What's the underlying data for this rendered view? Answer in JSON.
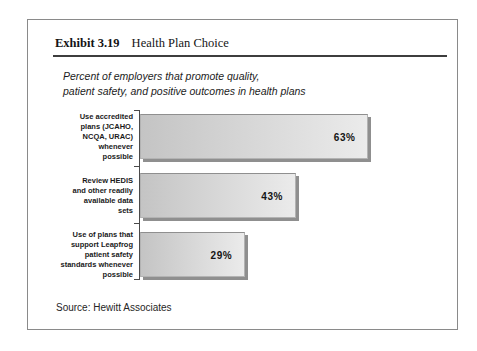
{
  "exhibit": {
    "number": "Exhibit 3.19",
    "title": "Health Plan Choice"
  },
  "subtitle": "Percent of employers that promote quality,\npatient safety, and positive outcomes in health plans",
  "source": "Source: Hewitt Associates",
  "chart_data": {
    "type": "bar",
    "orientation": "horizontal",
    "title": "Percent of employers that promote quality, patient safety, and positive outcomes in health plans",
    "categories": [
      "Use accredited\nplans (JCAHO,\nNCQA, URAC)\nwhenever\npossible",
      "Review HEDIS\nand other readily\navailable data\nsets",
      "Use of plans that\nsupport Leapfrog\npatient safety\nstandards whenever\npossible"
    ],
    "values": [
      63,
      43,
      29
    ],
    "value_labels": [
      "63%",
      "43%",
      "29%"
    ],
    "xlabel": "",
    "ylabel": "",
    "xlim": [
      0,
      88
    ],
    "grid": false,
    "legend": "none",
    "bar_color_start": "#c4c4c4",
    "bar_color_end": "#ebebeb",
    "shadow_color": "#8f8f8f",
    "axis_color": "#4a4a4a"
  }
}
